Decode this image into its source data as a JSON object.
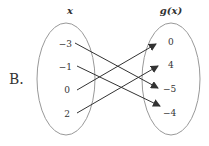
{
  "option_label": "B.",
  "domain_header": "x",
  "range_header": "g(x)",
  "domain_values": [
    "−3",
    "−1",
    "0",
    "2"
  ],
  "range_values": [
    "0",
    "4",
    "−5",
    "−4"
  ],
  "mappings": [
    {
      "from": "−3",
      "to": "−5"
    },
    {
      "from": "−1",
      "to": "−4"
    },
    {
      "from": "0",
      "to": "0"
    },
    {
      "from": "2",
      "to": "4"
    }
  ],
  "colors": {
    "ellipse": "#999999",
    "arrow": "#333333",
    "text": "#333333"
  }
}
